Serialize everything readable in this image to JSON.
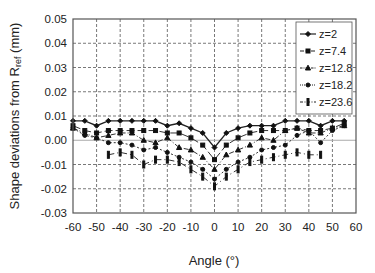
{
  "chart_data": {
    "type": "line",
    "title": "",
    "xlabel": "Angle (°)",
    "ylabel": "Shape deviations from R_ref (mm)",
    "ylabel_main": "Shape deviations from R",
    "ylabel_sub": "ref",
    "ylabel_unit": " (mm)",
    "xlim": [
      -60,
      60
    ],
    "ylim": [
      -0.03,
      0.05
    ],
    "xticks": [
      -60,
      -50,
      -40,
      -30,
      -20,
      -10,
      0,
      10,
      20,
      30,
      40,
      50,
      60
    ],
    "yticks": [
      "0.05",
      "0.04",
      "0.03",
      "0.02",
      "0.01",
      "0.00",
      "-0.01",
      "-0.02",
      "-0.03"
    ],
    "grid": true,
    "legend_position": "upper right",
    "series": [
      {
        "name": "z=2",
        "marker": "diamond",
        "dash": "",
        "x": [
          -60,
          -55,
          -50,
          -45,
          -40,
          -35,
          -30,
          -25,
          -20,
          -15,
          -10,
          -5,
          0,
          5,
          10,
          15,
          20,
          25,
          30,
          35,
          40,
          45,
          50,
          55
        ],
        "values": [
          0.008,
          0.008,
          0.006,
          0.008,
          0.008,
          0.008,
          0.008,
          0.008,
          0.006,
          0.007,
          0.005,
          0.003,
          -0.003,
          0.003,
          0.005,
          0.006,
          0.006,
          0.006,
          0.008,
          0.008,
          0.008,
          0.006,
          0.008,
          0.008
        ]
      },
      {
        "name": "z=7.4",
        "marker": "square",
        "dash": "8,3",
        "x": [
          -60,
          -55,
          -50,
          -45,
          -40,
          -35,
          -30,
          -25,
          -20,
          -15,
          -10,
          -5,
          0,
          5,
          10,
          15,
          20,
          25,
          30,
          35,
          40,
          45,
          50,
          55
        ],
        "values": [
          0.006,
          0.004,
          0.003,
          0.004,
          0.004,
          0.004,
          0.004,
          0.004,
          0.003,
          0.003,
          0.001,
          -0.002,
          -0.008,
          -0.002,
          0.001,
          0.003,
          0.004,
          0.004,
          0.004,
          0.005,
          0.004,
          0.004,
          0.005,
          0.007
        ]
      },
      {
        "name": "z=12.8",
        "marker": "triangle",
        "dash": "5,2,1,2",
        "x": [
          -60,
          -55,
          -50,
          -45,
          -40,
          -35,
          -30,
          -25,
          -20,
          -15,
          -10,
          -5,
          0,
          5,
          10,
          15,
          20,
          25,
          30,
          35,
          40,
          45,
          50,
          55
        ],
        "values": [
          0.005,
          0.003,
          0.001,
          0.002,
          0.003,
          0.003,
          0.0,
          -0.001,
          0.001,
          -0.003,
          -0.004,
          -0.007,
          -0.012,
          -0.006,
          -0.004,
          -0.002,
          0.001,
          0.0,
          0.004,
          0.005,
          0.003,
          0.003,
          0.005,
          0.006
        ]
      },
      {
        "name": "z=18.2",
        "marker": "circle",
        "dash": "2,2",
        "x": [
          -60,
          -55,
          -50,
          -45,
          -40,
          -35,
          -30,
          -25,
          -20,
          -15,
          -10,
          -5,
          0,
          5,
          10,
          15,
          20,
          25,
          30,
          35,
          40,
          45,
          50,
          55
        ],
        "values": [
          0.005,
          0.002,
          0.001,
          -0.001,
          -0.001,
          -0.002,
          -0.004,
          -0.003,
          -0.005,
          -0.007,
          -0.009,
          -0.012,
          -0.016,
          -0.012,
          -0.009,
          -0.007,
          -0.004,
          -0.003,
          -0.002,
          0.002,
          0.004,
          -0.001,
          0.004,
          0.006
        ]
      },
      {
        "name": "z=23.6",
        "marker": "bar",
        "dash": "6,3,1,3",
        "x": [
          -45,
          -40,
          -35,
          -30,
          -25,
          -20,
          -15,
          -10,
          -5,
          0,
          5,
          10,
          15,
          20,
          25,
          30,
          35,
          40,
          45
        ],
        "values": [
          -0.006,
          -0.005,
          -0.006,
          -0.01,
          -0.008,
          -0.008,
          -0.009,
          -0.012,
          -0.015,
          -0.019,
          -0.015,
          -0.012,
          -0.009,
          -0.008,
          -0.007,
          -0.006,
          -0.005,
          -0.006,
          -0.006
        ]
      }
    ]
  }
}
